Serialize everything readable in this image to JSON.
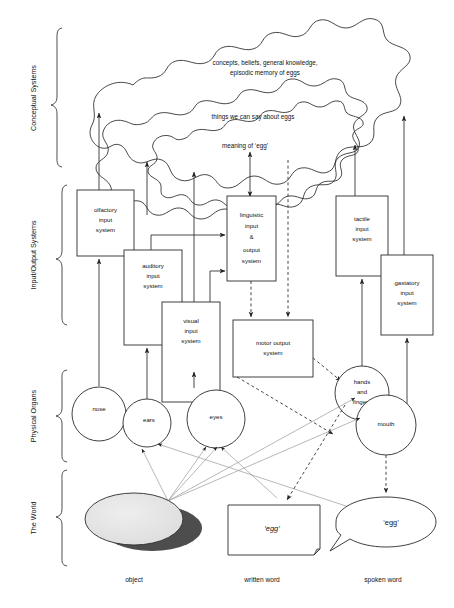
{
  "levels": [
    {
      "id": "conceptual",
      "label": "Conceptual Systems"
    },
    {
      "id": "io",
      "label": "Input/Output Systems"
    },
    {
      "id": "organs",
      "label": "Physical Organs"
    },
    {
      "id": "world",
      "label": "The World"
    }
  ],
  "conceptual_blobs": [
    {
      "id": "outer",
      "label_line1": "concepts, beliefs, general knowledge,",
      "label_line2": "episodic memory of eggs"
    },
    {
      "id": "middle",
      "label_line1": "things we can say about eggs",
      "label_line2": ""
    },
    {
      "id": "inner",
      "label_line1": "meaning of ‘egg’",
      "label_line2": ""
    }
  ],
  "boxes": [
    {
      "id": "olfactory",
      "lines": [
        "olfactory",
        "input",
        "system"
      ]
    },
    {
      "id": "auditory",
      "lines": [
        "auditory",
        "input",
        "system"
      ]
    },
    {
      "id": "visual",
      "lines": [
        "visual",
        "input",
        "system"
      ]
    },
    {
      "id": "linguistic",
      "lines": [
        "linguistic",
        "input",
        "&",
        "output",
        "system"
      ]
    },
    {
      "id": "motor",
      "lines": [
        "motor output",
        "system"
      ]
    },
    {
      "id": "tactile",
      "lines": [
        "tactile",
        "input",
        "system"
      ]
    },
    {
      "id": "gastatory",
      "lines": [
        "gastatory",
        "input",
        "system"
      ]
    }
  ],
  "organs": [
    {
      "id": "nose",
      "lines": [
        "nose"
      ]
    },
    {
      "id": "ears",
      "lines": [
        "ears"
      ]
    },
    {
      "id": "eyes",
      "lines": [
        "eyes"
      ]
    },
    {
      "id": "hands",
      "lines": [
        "hands",
        "and",
        "fingers"
      ]
    },
    {
      "id": "mouth",
      "lines": [
        "mouth"
      ]
    }
  ],
  "world": [
    {
      "id": "object",
      "label": "",
      "caption": "object"
    },
    {
      "id": "written-word",
      "label": "‘egg’",
      "caption": "written word"
    },
    {
      "id": "spoken-word",
      "label": "‘egg’",
      "caption": "spoken word"
    }
  ],
  "colors": {
    "stroke": "#2b2b2b",
    "gray_line": "#9a9a9a",
    "egg_fill": "#e3e3e3",
    "egg_shadow": "#4d4d4d",
    "background": "#ffffff"
  }
}
